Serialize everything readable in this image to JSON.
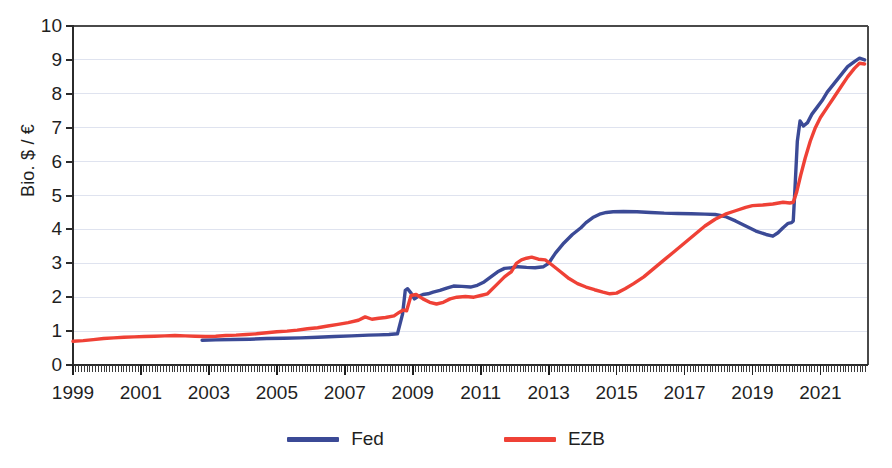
{
  "chart_data": {
    "type": "line",
    "title": "",
    "subtitle": "",
    "xlabel": "",
    "ylabel": "Bio. $ / €",
    "xlim": [
      1999,
      2022.4
    ],
    "ylim": [
      0,
      10
    ],
    "grid": true,
    "legend_position": "bottom",
    "y_ticks": [
      "0",
      "1",
      "2",
      "3",
      "4",
      "5",
      "6",
      "7",
      "8",
      "9",
      "10"
    ],
    "x_ticks": [
      "1999",
      "2001",
      "2003",
      "2005",
      "2007",
      "2009",
      "2011",
      "2013",
      "2015",
      "2017",
      "2019",
      "2021"
    ],
    "x_tick_values": [
      1999,
      2001,
      2003,
      2005,
      2007,
      2009,
      2011,
      2013,
      2015,
      2017,
      2019,
      2021
    ],
    "minor_ticks": "monthly",
    "colors": {
      "fed": "#3b4a96",
      "ezb": "#ef4136",
      "axis": "#2b2b2b",
      "grid": "#dfe3ef",
      "background": "#ffffff"
    },
    "series": [
      {
        "name": "Fed",
        "color": "#3b4a96",
        "x": [
          2002.8,
          2003.2,
          2003.7,
          2004.2,
          2004.7,
          2005.2,
          2005.7,
          2006.2,
          2006.7,
          2007.2,
          2007.7,
          2008.0,
          2008.3,
          2008.55,
          2008.7,
          2008.78,
          2008.85,
          2008.95,
          2009.05,
          2009.15,
          2009.3,
          2009.45,
          2009.6,
          2009.8,
          2010.0,
          2010.2,
          2010.45,
          2010.7,
          2010.9,
          2011.1,
          2011.3,
          2011.5,
          2011.7,
          2011.9,
          2012.1,
          2012.35,
          2012.6,
          2012.85,
          2013.0,
          2013.2,
          2013.45,
          2013.7,
          2013.95,
          2014.1,
          2014.3,
          2014.5,
          2014.7,
          2014.9,
          2015.2,
          2015.6,
          2016.0,
          2016.4,
          2016.8,
          2017.2,
          2017.6,
          2017.9,
          2018.2,
          2018.5,
          2018.8,
          2019.1,
          2019.4,
          2019.6,
          2019.75,
          2019.9,
          2020.05,
          2020.15,
          2020.2,
          2020.25,
          2020.32,
          2020.4,
          2020.5,
          2020.62,
          2020.75,
          2020.9,
          2021.05,
          2021.2,
          2021.4,
          2021.6,
          2021.8,
          2022.0,
          2022.15,
          2022.3
        ],
        "y": [
          0.73,
          0.74,
          0.75,
          0.76,
          0.78,
          0.79,
          0.8,
          0.82,
          0.84,
          0.86,
          0.88,
          0.89,
          0.9,
          0.92,
          1.5,
          2.2,
          2.25,
          2.12,
          1.95,
          2.02,
          2.08,
          2.1,
          2.15,
          2.2,
          2.27,
          2.33,
          2.32,
          2.3,
          2.35,
          2.45,
          2.6,
          2.75,
          2.85,
          2.87,
          2.9,
          2.88,
          2.87,
          2.9,
          3.0,
          3.3,
          3.6,
          3.85,
          4.05,
          4.2,
          4.35,
          4.45,
          4.5,
          4.52,
          4.53,
          4.52,
          4.5,
          4.48,
          4.47,
          4.46,
          4.45,
          4.44,
          4.38,
          4.25,
          4.1,
          3.95,
          3.85,
          3.8,
          3.9,
          4.05,
          4.18,
          4.2,
          4.25,
          5.2,
          6.6,
          7.2,
          7.05,
          7.15,
          7.4,
          7.6,
          7.8,
          8.05,
          8.3,
          8.55,
          8.8,
          8.95,
          9.05,
          9.0
        ]
      },
      {
        "name": "EZB",
        "color": "#ef4136",
        "x": [
          1999.0,
          1999.3,
          1999.6,
          1999.9,
          2000.2,
          2000.5,
          2000.8,
          2001.1,
          2001.4,
          2001.7,
          2002.0,
          2002.3,
          2002.6,
          2002.9,
          2003.2,
          2003.5,
          2003.8,
          2004.1,
          2004.4,
          2004.7,
          2005.0,
          2005.3,
          2005.6,
          2005.9,
          2006.2,
          2006.5,
          2006.8,
          2007.1,
          2007.4,
          2007.6,
          2007.8,
          2008.0,
          2008.2,
          2008.45,
          2008.6,
          2008.72,
          2008.82,
          2008.95,
          2009.1,
          2009.3,
          2009.5,
          2009.7,
          2009.9,
          2010.1,
          2010.3,
          2010.55,
          2010.8,
          2011.0,
          2011.2,
          2011.45,
          2011.7,
          2011.9,
          2012.05,
          2012.2,
          2012.35,
          2012.5,
          2012.7,
          2012.9,
          2013.1,
          2013.35,
          2013.6,
          2013.85,
          2014.1,
          2014.35,
          2014.6,
          2014.8,
          2015.0,
          2015.25,
          2015.5,
          2015.8,
          2016.1,
          2016.4,
          2016.7,
          2017.0,
          2017.3,
          2017.6,
          2017.9,
          2018.2,
          2018.5,
          2018.8,
          2019.0,
          2019.3,
          2019.6,
          2019.9,
          2020.1,
          2020.2,
          2020.3,
          2020.42,
          2020.55,
          2020.7,
          2020.85,
          2021.0,
          2021.2,
          2021.4,
          2021.6,
          2021.8,
          2022.0,
          2022.15,
          2022.3
        ],
        "y": [
          0.7,
          0.72,
          0.75,
          0.78,
          0.8,
          0.82,
          0.83,
          0.84,
          0.85,
          0.86,
          0.87,
          0.86,
          0.85,
          0.84,
          0.85,
          0.87,
          0.88,
          0.9,
          0.92,
          0.95,
          0.98,
          1.0,
          1.03,
          1.07,
          1.1,
          1.15,
          1.2,
          1.25,
          1.32,
          1.42,
          1.35,
          1.38,
          1.4,
          1.45,
          1.55,
          1.62,
          1.6,
          2.05,
          2.08,
          1.95,
          1.85,
          1.8,
          1.85,
          1.95,
          2.0,
          2.02,
          2.0,
          2.05,
          2.1,
          2.35,
          2.6,
          2.75,
          3.0,
          3.1,
          3.15,
          3.18,
          3.12,
          3.1,
          2.95,
          2.75,
          2.55,
          2.4,
          2.3,
          2.22,
          2.15,
          2.1,
          2.12,
          2.25,
          2.4,
          2.6,
          2.85,
          3.1,
          3.35,
          3.6,
          3.85,
          4.1,
          4.3,
          4.45,
          4.55,
          4.65,
          4.7,
          4.72,
          4.75,
          4.8,
          4.78,
          4.8,
          5.1,
          5.6,
          6.1,
          6.6,
          7.0,
          7.3,
          7.6,
          7.9,
          8.2,
          8.5,
          8.75,
          8.9,
          8.88
        ]
      }
    ]
  },
  "legend": {
    "items": [
      {
        "label": "Fed",
        "color": "#3b4a96"
      },
      {
        "label": "EZB",
        "color": "#ef4136"
      }
    ]
  }
}
